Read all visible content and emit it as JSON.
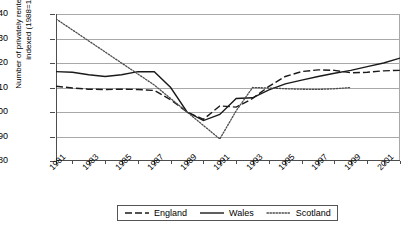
{
  "chart_data": {
    "type": "line",
    "title": "",
    "xlabel": "",
    "ylabel": "Number of privately rented dwellings\nindexed (1988=100)",
    "ylim": [
      80,
      140
    ],
    "ytick_values": [
      80,
      90,
      100,
      110,
      120,
      130,
      140
    ],
    "xlim": [
      1981,
      2002
    ],
    "xtick_values": [
      1981,
      1982,
      1983,
      1984,
      1985,
      1986,
      1987,
      1988,
      1989,
      1990,
      1991,
      1992,
      1993,
      1994,
      1995,
      1996,
      1997,
      1998,
      1999,
      2000,
      2001,
      2002
    ],
    "xtick_labels": [
      "1981",
      "1983",
      "1985",
      "1987",
      "1989",
      "1991",
      "1993",
      "1995",
      "1997",
      "1999",
      "2001"
    ],
    "xtick_label_values": [
      1981,
      1983,
      1985,
      1987,
      1989,
      1991,
      1993,
      1995,
      1997,
      1999,
      2001
    ],
    "grid": true,
    "legend_position": "bottom-center",
    "series": [
      {
        "name": "England",
        "style": "dashed",
        "color": "#1a1a1a",
        "x": [
          1981,
          1982,
          1983,
          1984,
          1985,
          1986,
          1987,
          1988,
          1989,
          1990,
          1991,
          1992,
          1993,
          1994,
          1995,
          1996,
          1997,
          1998,
          1999,
          2000,
          2001,
          2002
        ],
        "values": [
          110.5,
          109.8,
          109.3,
          109.2,
          109.3,
          109.2,
          108.8,
          105.0,
          100.0,
          97.0,
          102.5,
          102.0,
          105.5,
          110.5,
          114.5,
          116.5,
          117.2,
          117.0,
          116.0,
          116.2,
          116.8,
          117.0
        ]
      },
      {
        "name": "Wales",
        "style": "solid",
        "color": "#1a1a1a",
        "x": [
          1981,
          1982,
          1983,
          1984,
          1985,
          1986,
          1987,
          1988,
          1989,
          1990,
          1991,
          1992,
          1993,
          1994,
          1995,
          1996,
          1997,
          1998,
          1999,
          2000,
          2001,
          2002
        ],
        "values": [
          116.5,
          116.2,
          115.2,
          114.5,
          115.2,
          116.5,
          116.4,
          110.0,
          100.0,
          96.5,
          99.0,
          105.5,
          105.8,
          109.0,
          111.5,
          113.0,
          114.5,
          115.8,
          117.0,
          118.5,
          120.0,
          122.0
        ]
      },
      {
        "name": "Scotland",
        "style": "dotted",
        "color": "#4d4d4d",
        "x": [
          1981,
          1982,
          1983,
          1984,
          1985,
          1986,
          1987,
          1988,
          1989,
          1990,
          1991,
          1992,
          1993,
          1994,
          1995,
          1996,
          1997,
          1998,
          1999
        ],
        "values": [
          138.0,
          133.5,
          129.0,
          124.5,
          120.0,
          115.5,
          111.0,
          105.5,
          100.0,
          94.5,
          89.0,
          100.5,
          110.0,
          109.8,
          109.5,
          109.3,
          109.2,
          109.5,
          110.0
        ]
      }
    ]
  },
  "legend": {
    "items": [
      {
        "label": "England",
        "style": "dashed"
      },
      {
        "label": "Wales",
        "style": "solid"
      },
      {
        "label": "Scotland",
        "style": "dotted"
      }
    ]
  }
}
